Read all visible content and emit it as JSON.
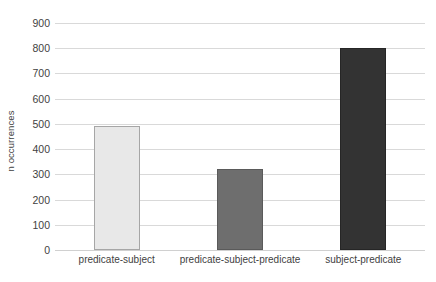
{
  "chart_data": {
    "type": "bar",
    "title": "",
    "xlabel": "",
    "ylabel": "n occurrences",
    "categories": [
      "predicate-subject",
      "predicate-subject-predicate",
      "subject-predicate"
    ],
    "values": [
      490,
      320,
      800
    ],
    "series": [
      {
        "name": "n occurrences",
        "values": [
          490,
          320,
          800
        ]
      }
    ],
    "ylim": [
      0,
      900
    ],
    "y_ticks": [
      0,
      100,
      200,
      300,
      400,
      500,
      600,
      700,
      800,
      900
    ],
    "y_tick_labels": [
      "0",
      "100",
      "200",
      "300",
      "400",
      "500",
      "600",
      "700",
      "800",
      "900"
    ],
    "grid": true,
    "grid_axis": "y",
    "legend": false,
    "legend_position": "none",
    "bar_colors": [
      "#e8e8e8",
      "#6e6e6e",
      "#333333"
    ],
    "bar_border_colors": [
      "#a6a6a6",
      "#5a5a5a",
      "#262626"
    ],
    "grid_color": "#d9d9d9",
    "background_color": "#ffffff",
    "text_color": "#3f3f3f"
  }
}
